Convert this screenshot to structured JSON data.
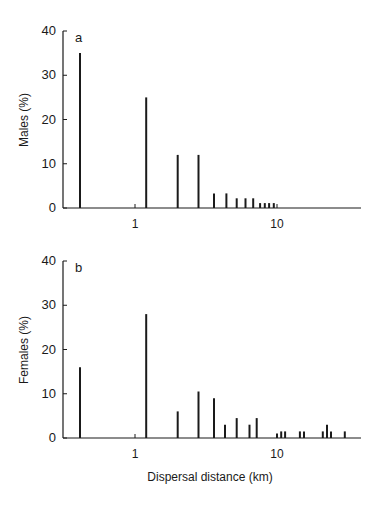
{
  "chart_data": [
    {
      "type": "bar",
      "panel_label": "a",
      "title": "",
      "xlabel": "",
      "ylabel": "Males (%)",
      "xscale": "log",
      "xticks": [
        "1",
        "10"
      ],
      "yticks": [
        "0",
        "10",
        "20",
        "30",
        "40"
      ],
      "ylim": [
        0,
        40
      ],
      "x": [
        0.41,
        1.2,
        2.0,
        2.8,
        3.6,
        4.4,
        5.2,
        6.0,
        6.8,
        7.6,
        8.2,
        8.8,
        9.5
      ],
      "values": [
        35,
        25,
        12,
        12,
        3.3,
        3.3,
        2.2,
        2.2,
        2.2,
        1.1,
        1.1,
        1.1,
        1.1
      ]
    },
    {
      "type": "bar",
      "panel_label": "b",
      "title": "",
      "xlabel": "Dispersal distance (km)",
      "ylabel": "Females (%)",
      "xscale": "log",
      "xticks": [
        "1",
        "10"
      ],
      "yticks": [
        "0",
        "10",
        "20",
        "30",
        "40"
      ],
      "ylim": [
        0,
        40
      ],
      "x": [
        0.41,
        1.2,
        2.0,
        2.8,
        3.6,
        4.3,
        5.2,
        6.4,
        7.2,
        10,
        10.7,
        11.4,
        14.5,
        15.5,
        21,
        22.5,
        24,
        30
      ],
      "values": [
        16,
        28,
        6,
        10.5,
        9,
        3,
        4.5,
        3,
        4.5,
        1,
        1.5,
        1.5,
        1.5,
        1.5,
        1.5,
        3,
        1.5,
        1.5
      ]
    }
  ],
  "panels": {
    "a": {
      "label": "a",
      "ylabel": "Males (%)"
    },
    "b": {
      "label": "b",
      "ylabel": "Females (%)"
    }
  },
  "axis": {
    "xlabel": "Dispersal distance (km)",
    "xtick_1": "1",
    "xtick_10": "10",
    "yticks": [
      "0",
      "10",
      "20",
      "30",
      "40"
    ]
  }
}
